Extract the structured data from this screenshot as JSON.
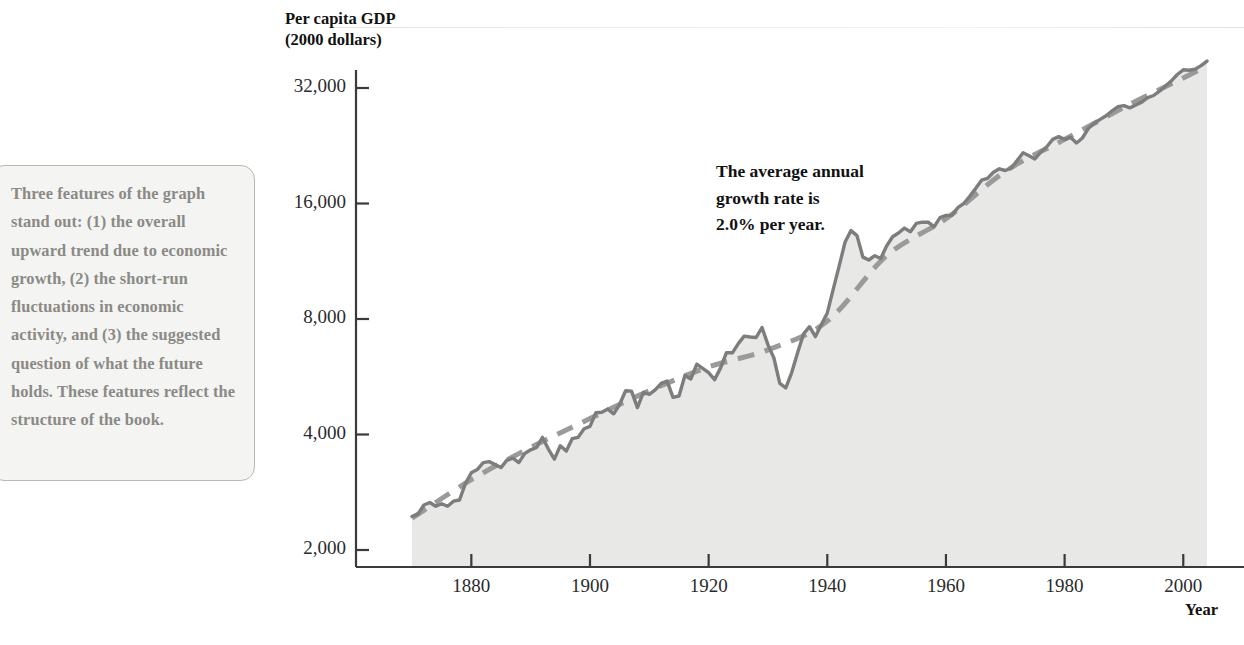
{
  "sidebar": {
    "callout_text": "Three features of the graph stand out: (1) the overall upward trend due to economic growth, (2) the short-run fluctuations in economic activity, and (3) the suggested question of what the future holds. These features reflect the structure of the book."
  },
  "annotation": {
    "growth_note": "The average annual\ngrowth rate is\n2.0% per year."
  },
  "colors": {
    "series_line": "#7d7d7d",
    "trend_line": "#9a9a9a",
    "area_fill": "#e8e8e6",
    "axis": "#3a3a3a",
    "callout_text": "#8a8a86",
    "callout_border": "#b9b9b4",
    "callout_background": "#f4f4f2"
  },
  "chart_data": {
    "type": "line",
    "title": "",
    "xlabel": "Year",
    "ylabel": "Per capita GDP\n(2000 dollars)",
    "yscale": "log2",
    "ylim": [
      2000,
      36000
    ],
    "xlim": [
      1869,
      2004
    ],
    "yticks": [
      2000,
      4000,
      8000,
      16000,
      32000
    ],
    "ytick_labels": [
      "2,000",
      "4,000",
      "8,000",
      "16,000",
      "32,000"
    ],
    "xticks": [
      1880,
      1900,
      1920,
      1940,
      1960,
      1980,
      2000
    ],
    "xtick_labels": [
      "1880",
      "1900",
      "1920",
      "1940",
      "1960",
      "1980",
      "2000"
    ],
    "grid": false,
    "legend": "none",
    "annotations": [
      {
        "text": "The average annual growth rate is 2.0% per year.",
        "x": 1938,
        "y": 18000
      }
    ],
    "series": [
      {
        "name": "Per capita GDP",
        "style": "solid",
        "fill": true,
        "x": [
          1870,
          1871,
          1872,
          1873,
          1874,
          1875,
          1876,
          1877,
          1878,
          1879,
          1880,
          1881,
          1882,
          1883,
          1884,
          1885,
          1886,
          1887,
          1888,
          1889,
          1890,
          1891,
          1892,
          1893,
          1894,
          1895,
          1896,
          1897,
          1898,
          1899,
          1900,
          1901,
          1902,
          1903,
          1904,
          1905,
          1906,
          1907,
          1908,
          1909,
          1910,
          1911,
          1912,
          1913,
          1914,
          1915,
          1916,
          1917,
          1918,
          1919,
          1920,
          1921,
          1922,
          1923,
          1924,
          1925,
          1926,
          1927,
          1928,
          1929,
          1930,
          1931,
          1932,
          1933,
          1934,
          1935,
          1936,
          1937,
          1938,
          1939,
          1940,
          1941,
          1942,
          1943,
          1944,
          1945,
          1946,
          1947,
          1948,
          1949,
          1950,
          1951,
          1952,
          1953,
          1954,
          1955,
          1956,
          1957,
          1958,
          1959,
          1960,
          1961,
          1962,
          1963,
          1964,
          1965,
          1966,
          1967,
          1968,
          1969,
          1970,
          1971,
          1972,
          1973,
          1974,
          1975,
          1976,
          1977,
          1978,
          1979,
          1980,
          1981,
          1982,
          1983,
          1984,
          1985,
          1986,
          1987,
          1988,
          1989,
          1990,
          1991,
          1992,
          1993,
          1994,
          1995,
          1996,
          1997,
          1998,
          1999,
          2000,
          2001,
          2002,
          2003,
          2004
        ],
        "y": [
          2445,
          2480,
          2620,
          2660,
          2600,
          2640,
          2600,
          2680,
          2700,
          2980,
          3180,
          3240,
          3380,
          3400,
          3340,
          3280,
          3430,
          3470,
          3380,
          3570,
          3650,
          3700,
          3930,
          3660,
          3450,
          3740,
          3620,
          3900,
          3930,
          4140,
          4200,
          4560,
          4570,
          4660,
          4530,
          4790,
          5200,
          5190,
          4700,
          5150,
          5090,
          5230,
          5440,
          5510,
          5000,
          5040,
          5700,
          5580,
          6100,
          5950,
          5800,
          5560,
          5960,
          6540,
          6530,
          6900,
          7220,
          7180,
          7160,
          7600,
          6850,
          6330,
          5440,
          5290,
          5800,
          6530,
          7320,
          7640,
          7200,
          7740,
          8300,
          9560,
          11000,
          12700,
          13600,
          13200,
          11600,
          11400,
          11700,
          11500,
          12400,
          13100,
          13400,
          13800,
          13500,
          14200,
          14300,
          14300,
          13900,
          14700,
          14900,
          14900,
          15600,
          16000,
          16700,
          17500,
          18400,
          18600,
          19300,
          19700,
          19500,
          19800,
          20700,
          21700,
          21300,
          20900,
          21800,
          22500,
          23500,
          23900,
          23500,
          23800,
          23000,
          23700,
          25100,
          25900,
          26500,
          27100,
          27900,
          28600,
          28800,
          28400,
          28900,
          29400,
          30200,
          30600,
          31400,
          32400,
          33400,
          34700,
          35700,
          35600,
          35800,
          36600,
          37600
        ]
      },
      {
        "name": "Trend (2.0% per year)",
        "style": "dashed",
        "fill": false,
        "x": [
          1870,
          1880,
          1890,
          1900,
          1910,
          1920,
          1930,
          1940,
          1950,
          1960,
          1970,
          1980,
          1990,
          2000,
          2004
        ],
        "y": [
          2420,
          3050,
          3700,
          4400,
          5200,
          6000,
          6650,
          7900,
          11700,
          14600,
          19400,
          23500,
          28500,
          34000,
          36500
        ]
      }
    ]
  }
}
